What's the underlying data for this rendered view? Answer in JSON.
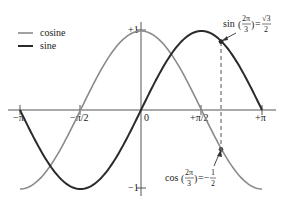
{
  "chart_data": {
    "type": "line",
    "title": "",
    "xlabel": "",
    "ylabel": "",
    "xlim": [
      -3.14159,
      3.14159
    ],
    "ylim": [
      -1,
      1
    ],
    "grid": false,
    "legend_position": "upper-left",
    "x_ticks": [
      {
        "value": -3.14159,
        "label": "−π"
      },
      {
        "value": -1.5708,
        "label": "−π/2"
      },
      {
        "value": 0,
        "label": "0"
      },
      {
        "value": 1.5708,
        "label": "+π/2"
      },
      {
        "value": 3.14159,
        "label": "+π"
      }
    ],
    "y_ticks": [
      {
        "value": 1,
        "label": "+1"
      },
      {
        "value": -1,
        "label": "−1"
      }
    ],
    "series": [
      {
        "name": "cosine",
        "function": "cos(x)",
        "color": "#8a8a8a",
        "width": 1.6
      },
      {
        "name": "sine",
        "function": "sin(x)",
        "color": "#2a2a2a",
        "width": 2.0
      }
    ],
    "x_samples": [
      -3.14159,
      -2.35619,
      -1.5708,
      -0.7854,
      0,
      0.7854,
      1.5708,
      2.0944,
      2.35619,
      3.14159
    ],
    "cosine_values": [
      -1,
      -0.7071,
      0,
      0.7071,
      1,
      0.7071,
      0,
      -0.5,
      -0.7071,
      -1
    ],
    "sine_values": [
      0,
      -0.7071,
      -1,
      -0.7071,
      0,
      0.7071,
      1,
      0.866,
      0.7071,
      0
    ],
    "annotations": [
      {
        "x": 2.0944,
        "y": 0.866,
        "series": "sine",
        "text_func": "sin",
        "arg_num": "2π",
        "arg_den": "3",
        "equals": "=",
        "value_num": "√3",
        "value_den": "2"
      },
      {
        "x": 2.0944,
        "y": -0.5,
        "series": "cosine",
        "text_func": "cos",
        "arg_num": "2π",
        "arg_den": "3",
        "equals": "=−",
        "value_num": "1",
        "value_den": "2"
      }
    ],
    "reference_line": {
      "x": 2.0944,
      "style": "dashed"
    }
  },
  "legend": {
    "items": [
      {
        "label": "cosine",
        "color": "#8a8a8a"
      },
      {
        "label": "sine",
        "color": "#2a2a2a"
      }
    ]
  },
  "axis": {
    "tick_neg_pi": "−π",
    "tick_neg_half_pi": "−π/2",
    "tick_zero": "0",
    "tick_pos_half_pi": "+π/2",
    "tick_pos_pi": "+π",
    "tick_pos_one": "+1",
    "tick_neg_one": "−1"
  },
  "annotation_sin": {
    "func": "sin",
    "num": "2π",
    "den": "3",
    "eq": "=",
    "vnum": "√3",
    "vden": "2"
  },
  "annotation_cos": {
    "func": "cos",
    "num": "2π",
    "den": "3",
    "eq": "=−",
    "vnum": "1",
    "vden": "2"
  }
}
